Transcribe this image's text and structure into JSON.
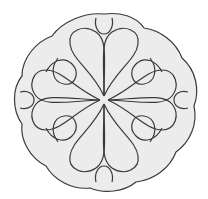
{
  "image": {
    "subject": "Quilting-style motif: scalloped circle with looping interlaced curves",
    "colors": {
      "background": "#ffffff",
      "fill": "#ececec",
      "stroke": "#3a3a3a"
    }
  }
}
